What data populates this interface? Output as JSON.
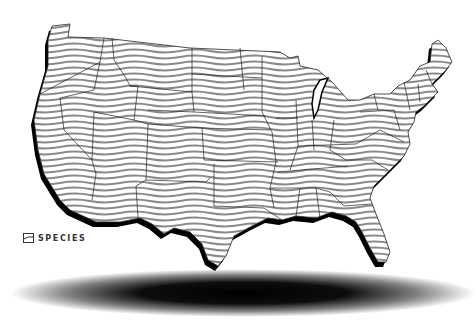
{
  "map": {
    "title": "United States species map",
    "region": "Contiguous United States",
    "style": {
      "fill_pattern": "wavy-horizontal-lines",
      "line_color": "#8a8a8a",
      "border_color": "#222222",
      "extrusion_color": "#000000",
      "background": "#ffffff",
      "ground_shadow": "#000000"
    }
  },
  "legend": {
    "items": [
      {
        "label": "SPECIES",
        "icon": "wavy-hatch-swatch"
      }
    ]
  }
}
